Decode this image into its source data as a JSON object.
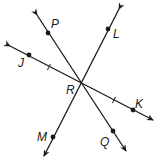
{
  "diagram": {
    "type": "intersecting-lines",
    "colors": {
      "stroke": "#1a1a1a",
      "background": "#ffffff"
    },
    "intersection": {
      "label": "R",
      "x": 80,
      "y": 84,
      "label_x": 66,
      "label_y": 94
    },
    "lines": [
      {
        "name": "line-PQ",
        "start": {
          "x": 37,
          "y": 15
        },
        "end": {
          "x": 126,
          "y": 151
        },
        "points": [
          {
            "label": "P",
            "x": 48,
            "y": 33,
            "label_x": 51,
            "label_y": 28
          },
          {
            "label": "Q",
            "x": 113,
            "y": 131,
            "label_x": 100,
            "label_y": 146
          }
        ]
      },
      {
        "name": "line-LM",
        "start": {
          "x": 119,
          "y": 9
        },
        "end": {
          "x": 44,
          "y": 156
        },
        "points": [
          {
            "label": "L",
            "x": 108,
            "y": 29,
            "label_x": 113,
            "label_y": 38
          },
          {
            "label": "M",
            "x": 53,
            "y": 137,
            "label_x": 37,
            "label_y": 141
          }
        ]
      },
      {
        "name": "line-JK",
        "start": {
          "x": 10,
          "y": 46
        },
        "end": {
          "x": 153,
          "y": 120
        },
        "points": [
          {
            "label": "J",
            "x": 29,
            "y": 55,
            "label_x": 18,
            "label_y": 67
          },
          {
            "label": "K",
            "x": 133,
            "y": 110,
            "label_x": 135,
            "label_y": 108
          }
        ]
      }
    ],
    "tick_marks": [
      {
        "x": 49,
        "y": 67,
        "note": "congruence mark on segment JR"
      },
      {
        "x": 114,
        "y": 100,
        "note": "congruence mark on segment RK"
      }
    ]
  }
}
